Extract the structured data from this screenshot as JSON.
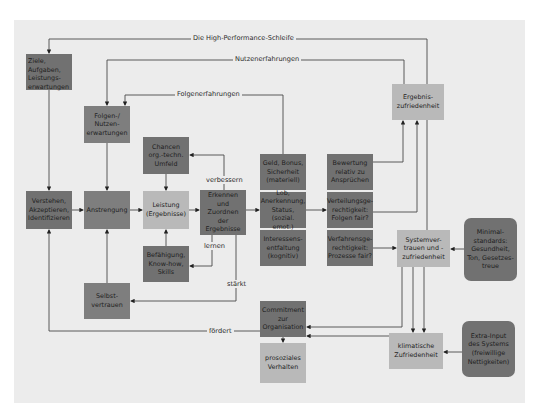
{
  "diagram": {
    "title": "Die High-Performance-Schleife",
    "boxes": {
      "ziele": "Ziele, Aufgaben, Leistungs-erwartungen",
      "folgen": "Folgen-/ Nutzen-erwartungen",
      "chancen": "Chancen org.-techn. Umfeld",
      "verstehen": "Verstehen, Akzeptieren, Identifizieren",
      "anstrengung": "Anstrengung",
      "leistung": "Leistung (Ergebnisse)",
      "erkennen": "Erkennen und Zuordnen der Ergebnisse",
      "befaehigung": "Befähigung, Know-how, Skills",
      "selbstvertrauen": "Selbst-vertrauen",
      "geld": "Geld, Bonus, Sicherheit (materiell)",
      "lob": "Lob, Anerkennung, Status, (sozial. emot.)",
      "interessen": "Interessens-entfaltung (kognitiv)",
      "bewertung": "Bewertung relativ zu Ansprüchen",
      "verteilung": "Verteilungsge-rechtigkeit: Folgen fair?",
      "verfahren": "Verfahrensge-rechtigkeit: Prozesse fair?",
      "ergebnis": "Ergebnis-zufriedenheit",
      "system": "Systemver-trauen und -zufriedenheit",
      "minimal": "Minimal-standards: Gesundheit, Ton, Gesetzes-treue",
      "commitment": "Commitment zur Organisation",
      "prosozial": "prosoziales Verhalten",
      "klimatisch": "klimatische Zufriedenheit",
      "extra": "Extra-Input des Systems (freiwillige Nettigkeiten)"
    },
    "labels": {
      "nutzen": "Nutzenerfahrungen",
      "folgen": "Folgenerfahrungen",
      "verbessern": "verbessern",
      "lernen": "lernen",
      "staerkt": "stärkt",
      "foerdert": "fördert"
    },
    "colors": {
      "panel": "#ececec",
      "dark_box": "#717171",
      "mid_box": "#7e7e7e",
      "light_box": "#b9b9b9",
      "line": "#3a3a3a"
    }
  }
}
